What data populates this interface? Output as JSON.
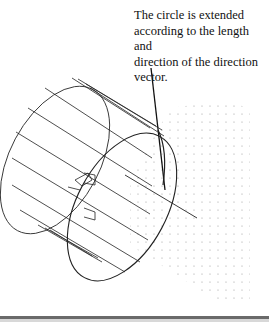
{
  "annotation": {
    "line1": "The circle is extended",
    "line2": "according to the length and",
    "line3": "direction of the direction",
    "line4": "vector."
  },
  "figure": {
    "stroke_color": "#222222",
    "grid_dot_color": "#9a9a9a"
  }
}
